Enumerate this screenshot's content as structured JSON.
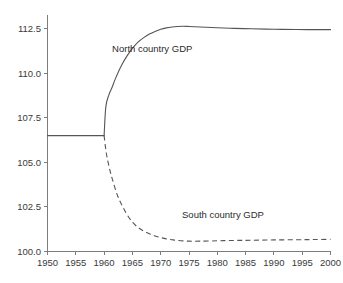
{
  "chart_data": {
    "type": "line",
    "title": "",
    "subtitle": "",
    "xlabel": "",
    "ylabel": "",
    "xlim": [
      1950,
      2000
    ],
    "ylim": [
      100.0,
      113.3
    ],
    "grid": false,
    "legend_position": "inline-annotations",
    "x_tick_labels": [
      "1950",
      "1955",
      "1960",
      "1965",
      "1970",
      "1975",
      "1980",
      "1985",
      "1990",
      "1995",
      "2000"
    ],
    "x_ticks": [
      1950,
      1955,
      1960,
      1965,
      1970,
      1975,
      1980,
      1985,
      1990,
      1995,
      2000
    ],
    "y_tick_labels": [
      "100.0",
      "102.5",
      "105.0",
      "107.5",
      "110.0",
      "112.5"
    ],
    "y_ticks": [
      100.0,
      102.5,
      105.0,
      107.5,
      110.0,
      112.5
    ],
    "annotations": [
      {
        "text": "North country GDP",
        "x": 1968.5,
        "y": 111.2
      },
      {
        "text": "South country GDP",
        "x": 1981.0,
        "y": 101.9
      }
    ],
    "series": [
      {
        "name": "Common pre-shock path",
        "style": "solid",
        "color": "#555555",
        "x": [
          1950,
          1952,
          1954,
          1956,
          1958,
          1960
        ],
        "values": [
          106.5,
          106.5,
          106.5,
          106.5,
          106.5,
          106.5
        ]
      },
      {
        "name": "North country GDP",
        "style": "solid",
        "color": "#555555",
        "x": [
          1960,
          1960.3,
          1960.8,
          1961.4,
          1962,
          1963,
          1964,
          1965,
          1966,
          1967,
          1968,
          1969,
          1970,
          1971,
          1972,
          1973,
          1974,
          1975,
          1977,
          1980,
          1983,
          1986,
          1990,
          1994,
          1997,
          2000
        ],
        "values": [
          106.5,
          108.1,
          108.75,
          109.2,
          109.7,
          110.4,
          110.95,
          111.4,
          111.75,
          112.0,
          112.2,
          112.35,
          112.47,
          112.55,
          112.6,
          112.63,
          112.64,
          112.63,
          112.6,
          112.56,
          112.52,
          112.5,
          112.47,
          112.46,
          112.45,
          112.45
        ]
      },
      {
        "name": "South country GDP",
        "style": "dashed",
        "color": "#555555",
        "x": [
          1960,
          1960.4,
          1961,
          1961.6,
          1962.3,
          1963,
          1964,
          1965,
          1966,
          1967,
          1968,
          1969,
          1970,
          1971,
          1972,
          1973,
          1975,
          1977,
          1980,
          1983,
          1986,
          1990,
          1994,
          1997,
          2000
        ],
        "values": [
          106.5,
          105.5,
          104.6,
          103.9,
          103.2,
          102.7,
          102.1,
          101.65,
          101.35,
          101.15,
          101.0,
          100.87,
          100.78,
          100.71,
          100.66,
          100.62,
          100.58,
          100.58,
          100.6,
          100.62,
          100.63,
          100.65,
          100.66,
          100.67,
          100.68
        ]
      }
    ]
  }
}
